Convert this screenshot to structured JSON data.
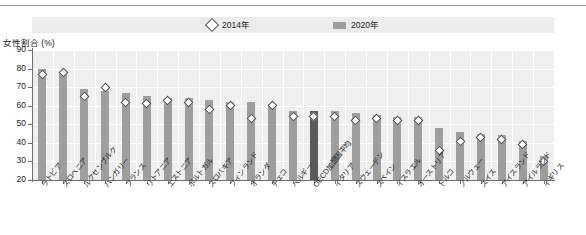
{
  "legend": {
    "series_2014_label": "2014年",
    "series_2020_label": "2020年",
    "marker_2014_icon": "diamond-outline-icon",
    "marker_2020_icon": "bar-swatch-icon"
  },
  "axis": {
    "y_title": "女性割合 (%)",
    "y_ticks": [
      "90",
      "80",
      "70",
      "60",
      "50",
      "40",
      "30",
      "20"
    ]
  },
  "chart_data": {
    "type": "bar",
    "title": "女性割合 (%)",
    "xlabel": "",
    "ylabel": "女性割合 (%)",
    "ylim": [
      20,
      90
    ],
    "ytick_values": [
      20,
      30,
      40,
      50,
      60,
      70,
      80,
      90
    ],
    "grid": true,
    "legend_position": "top",
    "highlight_category": "OECD加盟国平均",
    "categories": [
      "ラトビア",
      "スロベニア",
      "ルクセンブルク",
      "ハンガリー",
      "フランス",
      "リトアニア",
      "エストニア",
      "ポルトガル",
      "スロバキア",
      "フィンランド",
      "オランダ",
      "チェコ",
      "ベルギー",
      "OECD加盟国平均",
      "イタリア",
      "スウェーデン",
      "スペイン",
      "イスラエル",
      "オーストリア",
      "トルコ",
      "ノルウェー",
      "スイス",
      "アイスランド",
      "アイルランド",
      "イギリス"
    ],
    "series": [
      {
        "name": "2020年",
        "type": "bar",
        "color": "#9e9e9e",
        "values": [
          80,
          78,
          69,
          68,
          67,
          65,
          64,
          64,
          63,
          62,
          62,
          61,
          57,
          57,
          57,
          56,
          55,
          54,
          54,
          48,
          46,
          45,
          44,
          41,
          33
        ]
      },
      {
        "name": "2014年",
        "type": "marker",
        "marker": "diamond",
        "color": "#ffffff",
        "edge_color": "#4a4a4a",
        "values": [
          77,
          78,
          65,
          70,
          62,
          61,
          63,
          62,
          58,
          60,
          53,
          60,
          54,
          54,
          54,
          52,
          53,
          52,
          52,
          36,
          41,
          43,
          42,
          39,
          30
        ]
      }
    ]
  }
}
